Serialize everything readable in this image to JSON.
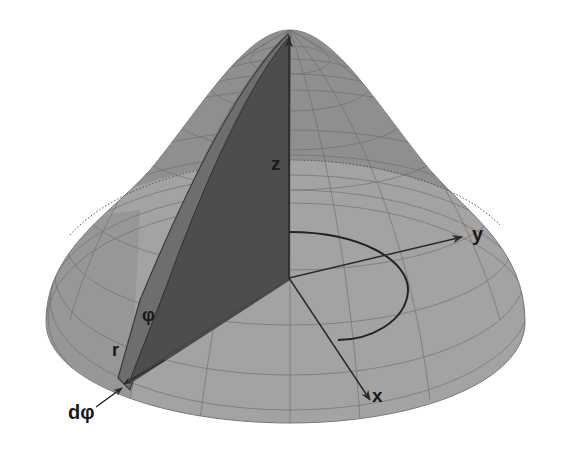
{
  "figure": {
    "colors": {
      "background": "#ffffff",
      "surface_back": "#8f8f8f",
      "surface_front": "#a3a3a3",
      "slice_fill": "#4d4d4d",
      "wedge_fill": "#6e6e6e",
      "grid_line": "#6a6a6a",
      "axis_line": "#2b2b2b",
      "label": "#1a1a1a"
    },
    "labels": {
      "z_axis": "z",
      "y_axis": "y",
      "x_axis": "x",
      "angle": "φ",
      "radius": "r",
      "angle_increment": "dφ"
    },
    "elements": [
      "paraboloid-surface",
      "mesh-grid",
      "dotted-level-curve",
      "vertical-slice",
      "wedge-strip",
      "z-axis-arrow",
      "x-axis-arrow",
      "y-axis-arrow",
      "angle-arc",
      "dphi-pointer-arrow"
    ]
  }
}
